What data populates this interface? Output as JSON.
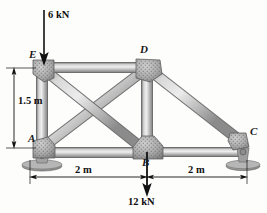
{
  "figure": {
    "kind": "truss-free-body-diagram",
    "background_color": "#fdfdfc",
    "member_color": "#b9b9b9",
    "member_edge_color": "#6e6e6e",
    "gusset_color": "#a8a8a8",
    "line_color": "#1a1a1a"
  },
  "joints": [
    {
      "id": "A",
      "label": "A",
      "x": 42,
      "y": 148,
      "support": "pin"
    },
    {
      "id": "B",
      "label": "B",
      "x": 147,
      "y": 152,
      "support": "none"
    },
    {
      "id": "C",
      "label": "C",
      "x": 243,
      "y": 143,
      "support": "roller"
    },
    {
      "id": "D",
      "label": "D",
      "x": 147,
      "y": 68,
      "support": "none"
    },
    {
      "id": "E",
      "label": "E",
      "x": 42,
      "y": 68,
      "support": "none"
    }
  ],
  "members": [
    {
      "from": "E",
      "to": "D",
      "name": "top-chord-ED"
    },
    {
      "from": "A",
      "to": "B",
      "name": "bottom-chord-AB"
    },
    {
      "from": "B",
      "to": "C",
      "name": "bottom-chord-BC"
    },
    {
      "from": "A",
      "to": "E",
      "name": "vertical-AE"
    },
    {
      "from": "B",
      "to": "D",
      "name": "vertical-BD"
    },
    {
      "from": "A",
      "to": "D",
      "name": "diagonal-AD"
    },
    {
      "from": "E",
      "to": "B",
      "name": "diagonal-EB"
    },
    {
      "from": "D",
      "to": "C",
      "name": "diagonal-DC"
    }
  ],
  "loads": [
    {
      "id": "load-6kN",
      "label": "6 kN",
      "magnitude": 6,
      "unit": "kN",
      "direction": "down",
      "applied_at": "E",
      "tail_x": 44,
      "tail_y": 10,
      "tip_x": 44,
      "tip_y": 63
    },
    {
      "id": "load-12kN",
      "label": "12 kN",
      "magnitude": 12,
      "unit": "kN",
      "direction": "down",
      "applied_at": "B",
      "tail_x": 147,
      "tail_y": 152,
      "tip_x": 147,
      "tip_y": 194
    }
  ],
  "dimensions": [
    {
      "id": "dim-height",
      "label": "1.5 m",
      "value": 1.5,
      "unit": "m",
      "orientation": "vertical",
      "from_y": 68,
      "to_y": 148,
      "axis_x": 14,
      "label_x": 18,
      "label_y": 101
    },
    {
      "id": "dim-span-left",
      "label": "2 m",
      "value": 2,
      "unit": "m",
      "orientation": "horizontal",
      "from_x": 30,
      "to_x": 147,
      "axis_y": 177,
      "label_x": 73,
      "label_y": 171
    },
    {
      "id": "dim-span-right",
      "label": "2 m",
      "value": 2,
      "unit": "m",
      "orientation": "horizontal",
      "from_x": 147,
      "to_x": 247,
      "axis_y": 177,
      "label_x": 185,
      "label_y": 171
    }
  ],
  "joint_label_positions": {
    "A": {
      "x": 30,
      "y": 139
    },
    "B": {
      "x": 143,
      "y": 156
    },
    "C": {
      "x": 250,
      "y": 131
    },
    "D": {
      "x": 141,
      "y": 50
    },
    "E": {
      "x": 29,
      "y": 55
    }
  }
}
